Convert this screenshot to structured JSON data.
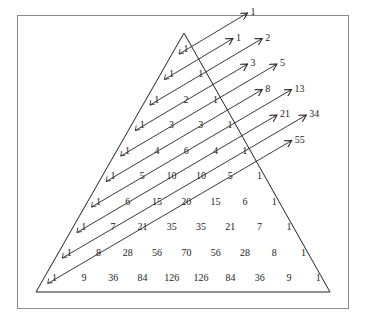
{
  "rows": [
    [
      1
    ],
    [
      1,
      1
    ],
    [
      1,
      2,
      1
    ],
    [
      1,
      3,
      3,
      1
    ],
    [
      1,
      4,
      6,
      4,
      1
    ],
    [
      1,
      5,
      10,
      10,
      5,
      1
    ],
    [
      1,
      6,
      15,
      20,
      15,
      6,
      1
    ],
    [
      1,
      7,
      21,
      35,
      35,
      21,
      7,
      1
    ],
    [
      1,
      8,
      28,
      56,
      70,
      56,
      28,
      8,
      1
    ],
    [
      1,
      9,
      36,
      84,
      126,
      126,
      84,
      36,
      9,
      1
    ]
  ],
  "fibonacci_sums": [
    1,
    1,
    2,
    3,
    5,
    8,
    13,
    21,
    34,
    55
  ],
  "colors": {
    "line": "#222222",
    "frame": "#8a8a8a",
    "text": "#222222"
  }
}
